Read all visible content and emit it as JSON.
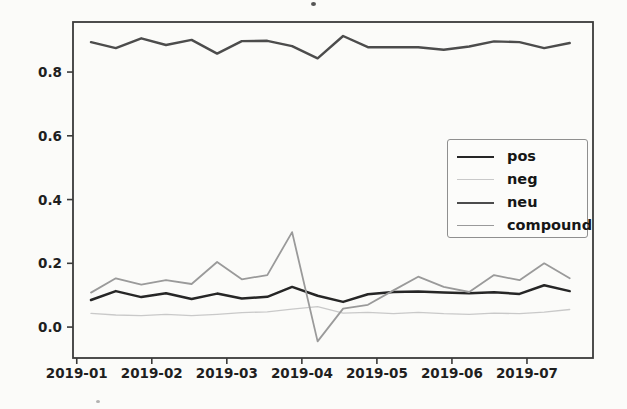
{
  "figure": {
    "background_color": "#fbfbf9",
    "axis_color": "#3a3a3a",
    "tick_label_color": "#1f1f1f"
  },
  "chart_data": {
    "type": "line",
    "title": "",
    "xlabel": "",
    "ylabel": "",
    "grid": false,
    "legend_position": "center right",
    "x_tick_labels": [
      "2019-01",
      "2019-02",
      "2019-03",
      "2019-04",
      "2019-05",
      "2019-06",
      "2019-07"
    ],
    "x_tick_months": [
      0,
      1,
      2,
      3,
      4,
      5,
      6
    ],
    "y_tick_labels": [
      "0.0",
      "0.2",
      "0.4",
      "0.6",
      "0.8"
    ],
    "y_ticks": [
      0.0,
      0.2,
      0.4,
      0.6,
      0.8
    ],
    "xlim_months": [
      -0.05,
      6.88
    ],
    "ylim": [
      -0.097,
      0.957
    ],
    "x_months": [
      0.19,
      0.52,
      0.86,
      1.19,
      1.53,
      1.87,
      2.2,
      2.54,
      2.87,
      3.21,
      3.55,
      3.88,
      4.22,
      4.55,
      4.89,
      5.23,
      5.56,
      5.9,
      6.23,
      6.57
    ],
    "series": [
      {
        "name": "pos",
        "color": "#262626",
        "line_width": 2.5,
        "values": [
          0.085,
          0.113,
          0.094,
          0.106,
          0.088,
          0.105,
          0.09,
          0.095,
          0.126,
          0.098,
          0.079,
          0.103,
          0.11,
          0.112,
          0.108,
          0.106,
          0.109,
          0.104,
          0.131,
          0.113
        ]
      },
      {
        "name": "neg",
        "color": "#c9c9c9",
        "line_width": 1.3,
        "values": [
          0.043,
          0.038,
          0.036,
          0.04,
          0.036,
          0.04,
          0.045,
          0.048,
          0.056,
          0.064,
          0.044,
          0.046,
          0.042,
          0.046,
          0.042,
          0.04,
          0.044,
          0.042,
          0.047,
          0.055
        ]
      },
      {
        "name": "neu",
        "color": "#4c4c4c",
        "line_width": 2.4,
        "values": [
          0.894,
          0.875,
          0.906,
          0.885,
          0.901,
          0.858,
          0.897,
          0.898,
          0.881,
          0.843,
          0.913,
          0.878,
          0.878,
          0.878,
          0.87,
          0.88,
          0.896,
          0.894,
          0.875,
          0.891
        ]
      },
      {
        "name": "compound",
        "color": "#9a9a9a",
        "line_width": 1.8,
        "values": [
          0.108,
          0.153,
          0.133,
          0.147,
          0.135,
          0.204,
          0.15,
          0.163,
          0.298,
          -0.045,
          0.058,
          0.07,
          0.115,
          0.158,
          0.126,
          0.11,
          0.163,
          0.147,
          0.2,
          0.153
        ]
      }
    ]
  }
}
